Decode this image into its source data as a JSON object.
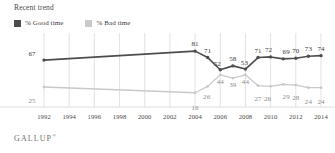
{
  "header": {
    "title": "Recent trend"
  },
  "legend": {
    "position": "top-left",
    "items": [
      {
        "label": "% Good time",
        "color": "#4d4d4d",
        "icon": "square-swatch"
      },
      {
        "label": "% Bad time",
        "color": "#c9c9c9",
        "icon": "square-swatch"
      }
    ]
  },
  "footer": {
    "brand": "GALLUP",
    "mark": "®"
  },
  "colors": {
    "good": "#4d4d4d",
    "bad": "#c9c9c9",
    "grid": "#d6d6d6",
    "text": "#3b3b3b"
  },
  "chart_data": {
    "type": "line",
    "title": "Recent trend",
    "xlabel": "",
    "ylabel": "",
    "grid": true,
    "legend_position": "top-left",
    "xlim": [
      1992,
      2014
    ],
    "ylim": [
      0,
      100
    ],
    "xticks": [
      1992,
      1994,
      1996,
      1998,
      2000,
      2002,
      2004,
      2006,
      2008,
      2010,
      2012,
      2014
    ],
    "x": [
      1992,
      2004,
      2005,
      2006,
      2007,
      2008,
      2009,
      2010,
      2011,
      2012,
      2013,
      2014
    ],
    "series": [
      {
        "name": "% Good time",
        "color": "#4d4d4d",
        "values": [
          67,
          81,
          71,
          52,
          58,
          53,
          71,
          72,
          69,
          70,
          73,
          74
        ],
        "labels": [
          "67",
          "81",
          "71",
          "52",
          "58",
          "53",
          "71",
          "72",
          "69",
          "70",
          "73",
          "74"
        ]
      },
      {
        "name": "% Bad time",
        "color": "#c9c9c9",
        "values": [
          25,
          16,
          26,
          44,
          39,
          44,
          27,
          26,
          29,
          28,
          24,
          24
        ],
        "labels": [
          "25",
          "16",
          "26",
          "44",
          "39",
          "44",
          "27",
          "26",
          "29",
          "28",
          "24",
          "24"
        ]
      }
    ]
  }
}
